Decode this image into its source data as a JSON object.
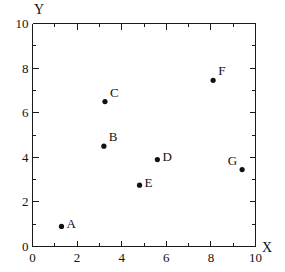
{
  "chart_data": {
    "type": "scatter",
    "title": "",
    "xlabel": "X",
    "ylabel": "Y",
    "xlim": [
      0,
      10
    ],
    "ylim": [
      0,
      10
    ],
    "grid": false,
    "legend": "none",
    "x_major_ticks": [
      0,
      2,
      4,
      6,
      8,
      10
    ],
    "y_major_ticks": [
      0,
      2,
      4,
      6,
      8,
      10
    ],
    "x_minor_ticks": [
      1,
      3,
      5,
      7,
      9
    ],
    "y_minor_ticks": [
      1,
      3,
      5,
      7,
      9
    ],
    "x_tick_labels": [
      "0",
      "2",
      "4",
      "6",
      "8",
      "10"
    ],
    "y_tick_labels": [
      "0",
      "2",
      "4",
      "6",
      "8",
      "10"
    ],
    "points": [
      {
        "label": "A",
        "x": 1.3,
        "y": 0.9,
        "label_position": "right"
      },
      {
        "label": "B",
        "x": 3.2,
        "y": 4.5,
        "label_position": "upper-right"
      },
      {
        "label": "C",
        "x": 3.25,
        "y": 6.5,
        "label_position": "upper-right"
      },
      {
        "label": "D",
        "x": 5.6,
        "y": 3.9,
        "label_position": "right"
      },
      {
        "label": "E",
        "x": 4.8,
        "y": 2.75,
        "label_position": "right"
      },
      {
        "label": "F",
        "x": 8.1,
        "y": 7.45,
        "label_position": "upper-right"
      },
      {
        "label": "G",
        "x": 9.4,
        "y": 3.45,
        "label_position": "upper-left"
      }
    ],
    "marker": {
      "shape": "filled-circle",
      "color": "#111111",
      "radius": 2.6
    },
    "axis_color": "#1a1a1a",
    "background_color": "#ffffff"
  },
  "figure": {
    "x_axis_title": "X",
    "y_axis_title": "Y"
  }
}
